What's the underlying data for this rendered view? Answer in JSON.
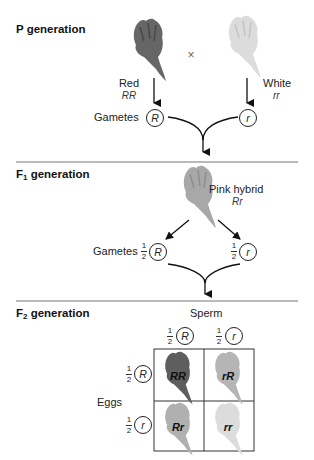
{
  "p_generation": {
    "title": "P generation",
    "cross_symbol": "×",
    "parent_left": {
      "phenotype": "Red",
      "genotype": "RR",
      "flower_shade": "#5e5e5e"
    },
    "parent_right": {
      "phenotype": "White",
      "genotype": "rr",
      "flower_shade": "#d9d9d9"
    },
    "gametes_label": "Gametes",
    "gamete_left": "R",
    "gamete_right": "r"
  },
  "f1_generation": {
    "title_prefix": "F",
    "title_sub": "1",
    "title_suffix": " generation",
    "offspring": {
      "phenotype": "Pink hybrid",
      "genotype": "Rr",
      "flower_shade": "#a8a8a8"
    },
    "gametes_label": "Gametes",
    "gamete_left": {
      "fraction_num": "1",
      "fraction_den": "2",
      "allele": "R"
    },
    "gamete_right": {
      "fraction_num": "1",
      "fraction_den": "2",
      "allele": "r"
    }
  },
  "f2_generation": {
    "title_prefix": "F",
    "title_sub": "2",
    "title_suffix": " generation",
    "sperm_label": "Sperm",
    "eggs_label": "Eggs",
    "sperm": [
      {
        "fraction_num": "1",
        "fraction_den": "2",
        "allele": "R"
      },
      {
        "fraction_num": "1",
        "fraction_den": "2",
        "allele": "r"
      }
    ],
    "eggs": [
      {
        "fraction_num": "1",
        "fraction_den": "2",
        "allele": "R"
      },
      {
        "fraction_num": "1",
        "fraction_den": "2",
        "allele": "r"
      }
    ],
    "punnett": [
      {
        "genotype": "RR",
        "flower_shade": "#5e5e5e"
      },
      {
        "genotype": "rR",
        "flower_shade": "#b5b5b5"
      },
      {
        "genotype": "Rr",
        "flower_shade": "#b0b0b0"
      },
      {
        "genotype": "rr",
        "flower_shade": "#dcdcdc"
      }
    ]
  }
}
